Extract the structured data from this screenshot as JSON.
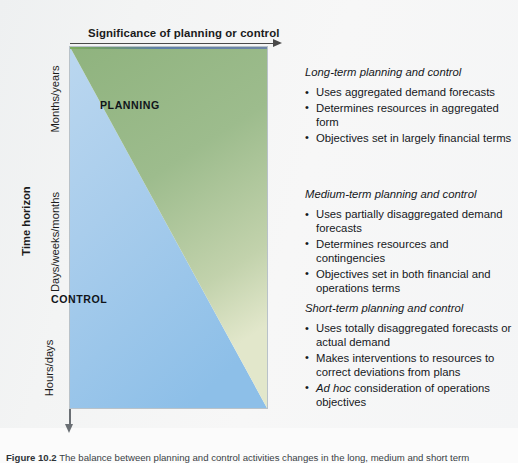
{
  "figure": {
    "top_axis_title": "Significance of planning or control",
    "side_axis_title": "Time horizon",
    "y_ticks": [
      "Months/years",
      "Days/weeks/months",
      "Hours/days"
    ],
    "zones": [
      {
        "label": "PLANNING",
        "color": "#9ab98a"
      },
      {
        "label": "CONTROL",
        "color": "#a8cdec"
      }
    ],
    "colors": {
      "planning_green": "#9ab98a",
      "control_blue": "#a8cdec",
      "axis_line": "#4a4a4a",
      "box_border": "#b9c2c9",
      "page_background": "#f4f5f5"
    }
  },
  "notes": [
    {
      "heading": "Long-term planning and control",
      "bullets": [
        "Uses aggregated demand forecasts",
        "Determines resources in aggregated form",
        "Objectives set in largely financial terms"
      ]
    },
    {
      "heading": "Medium-term planning and control",
      "bullets": [
        "Uses partially disaggregated demand forecasts",
        "Determines resources and contingencies",
        "Objectives set in both financial and operations terms"
      ]
    },
    {
      "heading": "Short-term planning and control",
      "bullets": [
        "Uses totally disaggregated forecasts or actual demand",
        "Makes interventions to resources to correct deviations from plans",
        "Ad hoc consideration of operations objectives"
      ]
    }
  ],
  "caption": {
    "label": "Figure 10.2",
    "text": "The balance between planning and control activities changes in the long, medium and short term"
  }
}
